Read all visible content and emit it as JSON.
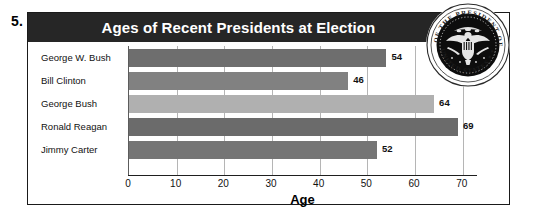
{
  "question_number": "5.",
  "chart_data": {
    "type": "bar",
    "orientation": "horizontal",
    "title": "Ages of Recent Presidents at Election",
    "xlabel": "Age",
    "ylabel": "",
    "categories": [
      "George W. Bush",
      "Bill Clinton",
      "George Bush",
      "Ronald Reagan",
      "Jimmy Carter"
    ],
    "values": [
      54,
      46,
      64,
      69,
      52
    ],
    "value_labels": [
      "54",
      "46",
      "64",
      "69",
      "52"
    ],
    "bar_colors": [
      "#6e6e6e",
      "#818181",
      "#b0b0b0",
      "#6b6b6b",
      "#757575"
    ],
    "xlim": [
      0,
      73
    ],
    "xticks": [
      0,
      10,
      20,
      30,
      40,
      50,
      60,
      70
    ],
    "xtick_labels": [
      "0",
      "10",
      "20",
      "30",
      "40",
      "50",
      "60",
      "70"
    ],
    "grid": true,
    "grid_axis": "x",
    "legend": false,
    "title_background": "#262626",
    "title_color": "#ffffff"
  },
  "decoration": {
    "seal_icon": "presidential-seal-icon",
    "seal_outer_text_top": "SEAL OF THE PRESIDENT OF THE",
    "seal_outer_text_bottom": "UNITED STATES"
  }
}
